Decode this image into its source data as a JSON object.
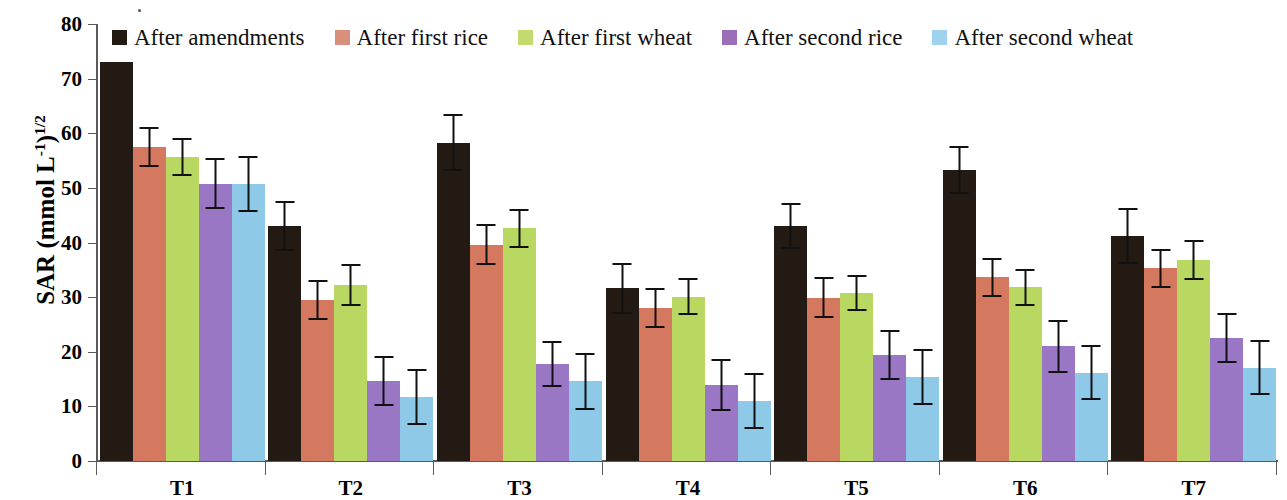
{
  "chart_data": {
    "type": "bar",
    "title": "",
    "subtitle": "",
    "xlabel": "",
    "ylabel": "SAR (mmol L-1)1/2",
    "ylabel_parts": {
      "main": "SAR (mmol L",
      "sup1": "-1",
      "mid": ")",
      "sup2": "1/2"
    },
    "categories": [
      "T1",
      "T2",
      "T3",
      "T4",
      "T5",
      "T6",
      "T7"
    ],
    "ylim": [
      0,
      80
    ],
    "yticks": [
      0,
      10,
      20,
      30,
      40,
      50,
      60,
      70,
      80
    ],
    "ytick_labels": [
      "0",
      "10",
      "20",
      "30",
      "40",
      "50",
      "60",
      "70",
      "80"
    ],
    "grid": false,
    "legend_position": "top",
    "error_bars": "standard deviation",
    "series": [
      {
        "name": "After amendments",
        "color": "#231a14",
        "values": [
          73.0,
          43.0,
          58.3,
          31.6,
          43.0,
          53.3,
          41.2
        ],
        "errors": [
          0.0,
          4.6,
          5.2,
          4.6,
          4.2,
          4.4,
          5.2
        ]
      },
      {
        "name": "After first rice",
        "color": "#d4785f",
        "values": [
          57.5,
          29.5,
          39.6,
          28.0,
          29.9,
          33.6,
          35.3
        ],
        "errors": [
          3.6,
          3.7,
          3.7,
          3.6,
          3.7,
          3.6,
          3.6
        ]
      },
      {
        "name": "After first wheat",
        "color": "#b9d861",
        "values": [
          55.6,
          32.2,
          42.6,
          30.1,
          30.8,
          31.8,
          36.8
        ],
        "errors": [
          3.5,
          3.9,
          3.6,
          3.4,
          3.3,
          3.4,
          3.6
        ]
      },
      {
        "name": "After second rice",
        "color": "#9a77c4",
        "values": [
          50.8,
          14.6,
          17.8,
          13.9,
          19.4,
          21.0,
          22.5
        ],
        "errors": [
          4.6,
          4.6,
          4.2,
          4.7,
          4.6,
          4.8,
          4.6
        ]
      },
      {
        "name": "After second wheat",
        "color": "#8ec9e8",
        "values": [
          50.7,
          11.7,
          14.6,
          11.0,
          15.4,
          16.2,
          17.1
        ],
        "errors": [
          5.1,
          5.1,
          5.2,
          5.1,
          5.1,
          5.0,
          5.1
        ]
      }
    ]
  },
  "legend": {
    "items": [
      {
        "label": "After amendments",
        "color": "#231a14"
      },
      {
        "label": "After first rice",
        "color": "#d98f7c"
      },
      {
        "label": "After first wheat",
        "color": "#c3da6e"
      },
      {
        "label": "After second rice",
        "color": "#9a6fb5"
      },
      {
        "label": "After second wheat",
        "color": "#9ed2ee"
      }
    ]
  }
}
